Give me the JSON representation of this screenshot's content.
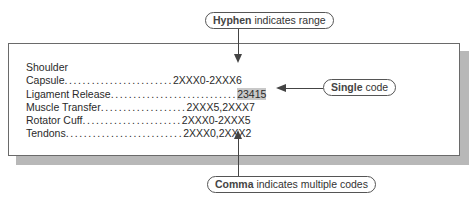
{
  "callouts": {
    "hyphen": {
      "bold": "Hyphen",
      "rest": " indicates range"
    },
    "single": {
      "bold": "Single",
      "rest": " code"
    },
    "comma": {
      "bold": "Comma",
      "rest": " indicates multiple codes"
    }
  },
  "index": {
    "heading": "Shoulder",
    "entries": [
      {
        "term": "Capsule",
        "dots": "........................",
        "code": "2XXX0-2XXX6"
      },
      {
        "term": "Ligament Release",
        "dots": "............................",
        "code": "23415"
      },
      {
        "term": "Muscle Transfer",
        "dots": "...................",
        "code": "2XXX5,2XXX7"
      },
      {
        "term": "Rotator Cuff",
        "dots": "......................",
        "code": "2XXX0-2XXX5"
      },
      {
        "term": "Tendons",
        "dots": "..........................",
        "code": "2XXX0,2XXX2"
      }
    ]
  },
  "colors": {
    "highlight": "#c8c8c8",
    "border": "#6a6a6a",
    "shadow": "#b8b8b8"
  }
}
